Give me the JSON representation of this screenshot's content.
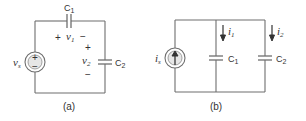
{
  "figure": {
    "panel_a": {
      "caption": "(a)",
      "source": {
        "type": "voltage-source",
        "label": "v",
        "subscript": "s",
        "plus": "+",
        "minus": "−"
      },
      "capacitor_1": {
        "label": "C",
        "subscript": "1",
        "voltage_label": "v",
        "voltage_subscript": "1",
        "plus": "+",
        "minus": "−"
      },
      "capacitor_2": {
        "label": "C",
        "subscript": "2",
        "voltage_label": "v",
        "voltage_subscript": "2",
        "plus": "+",
        "minus": "−"
      }
    },
    "panel_b": {
      "caption": "(b)",
      "source": {
        "type": "current-source",
        "label": "i",
        "subscript": "s"
      },
      "capacitor_1": {
        "label": "C",
        "subscript": "1",
        "current_label": "i",
        "current_subscript": "1"
      },
      "capacitor_2": {
        "label": "C",
        "subscript": "2",
        "current_label": "i",
        "current_subscript": "2"
      }
    }
  }
}
